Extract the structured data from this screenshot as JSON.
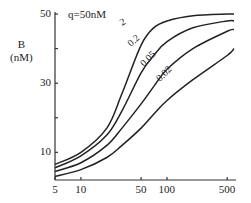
{
  "chart_data": {
    "type": "line",
    "title": "",
    "annotation": "q=50nM",
    "xlabel": "",
    "ylabel": "B\n(nM)",
    "ylabel_lines": [
      "B",
      "(nM)"
    ],
    "xscale": "log",
    "xlim": [
      5,
      600
    ],
    "ylim": [
      2,
      50
    ],
    "xticks": [
      5,
      10,
      50,
      100,
      500
    ],
    "xtick_labels": [
      "5",
      "10",
      "50",
      "100",
      "500"
    ],
    "yticks": [
      10,
      30,
      50
    ],
    "ytick_labels": [
      "10",
      "30",
      "50"
    ],
    "grid": false,
    "legend": "inline curve labels",
    "series": [
      {
        "name": "2",
        "x": [
          5,
          10,
          20,
          30,
          50,
          70,
          100,
          200,
          500,
          600
        ],
        "y": [
          6.5,
          10,
          17,
          27,
          41,
          46,
          48,
          49.5,
          50,
          50
        ]
      },
      {
        "name": "0.2",
        "x": [
          5,
          10,
          20,
          30,
          50,
          70,
          100,
          200,
          500,
          600
        ],
        "y": [
          5.5,
          9,
          15,
          22,
          33,
          38,
          42,
          46,
          48,
          48
        ]
      },
      {
        "name": "0.05",
        "x": [
          5,
          10,
          20,
          30,
          50,
          70,
          100,
          200,
          500,
          600
        ],
        "y": [
          4.5,
          7,
          12,
          17,
          24,
          29,
          34,
          40,
          45,
          45.5
        ]
      },
      {
        "name": "0.02",
        "x": [
          5,
          10,
          20,
          30,
          50,
          70,
          100,
          200,
          500,
          600
        ],
        "y": [
          3,
          5,
          8.5,
          12,
          17,
          21,
          25,
          31,
          38,
          40
        ]
      }
    ]
  }
}
